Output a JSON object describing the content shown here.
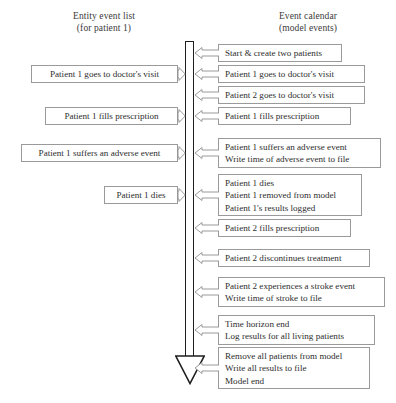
{
  "headings": {
    "left": {
      "line1": "Entity event list",
      "line2": "(for patient 1)"
    },
    "right": {
      "line1": "Event calendar",
      "line2": "(model events)"
    }
  },
  "timeline": {
    "name": "simulation-time-arrow",
    "direction": "downward",
    "color": "#1e1e1e"
  },
  "left_events": [
    {
      "lines": [
        "Patient 1 goes to doctor's visit"
      ],
      "x": 31,
      "y": 65,
      "w": 147,
      "h": 18
    },
    {
      "lines": [
        "Patient 1 fills prescription"
      ],
      "x": 45,
      "y": 107,
      "w": 133,
      "h": 18
    },
    {
      "lines": [
        "Patient 1 suffers an adverse event"
      ],
      "x": 21,
      "y": 144,
      "w": 157,
      "h": 18
    },
    {
      "lines": [
        "Patient 1 dies"
      ],
      "x": 104,
      "y": 186,
      "w": 74,
      "h": 18
    }
  ],
  "right_events": [
    {
      "lines": [
        "Start & create two patients"
      ],
      "x": 218,
      "y": 44,
      "w": 124,
      "h": 18
    },
    {
      "lines": [
        "Patient 1 goes to doctor's visit"
      ],
      "x": 218,
      "y": 65,
      "w": 147,
      "h": 18
    },
    {
      "lines": [
        "Patient 2 goes to doctor's visit"
      ],
      "x": 218,
      "y": 86,
      "w": 147,
      "h": 18
    },
    {
      "lines": [
        "Patient 1 fills prescription"
      ],
      "x": 218,
      "y": 107,
      "w": 133,
      "h": 18
    },
    {
      "lines": [
        "Patient 1 suffers an adverse event",
        "Write time of adverse event to file"
      ],
      "x": 218,
      "y": 138,
      "w": 163,
      "h": 30
    },
    {
      "lines": [
        "Patient 1 dies",
        "Patient 1 removed from model",
        "Patient 1's results logged"
      ],
      "x": 218,
      "y": 174,
      "w": 144,
      "h": 42
    },
    {
      "lines": [
        "Patient 2 fills prescription"
      ],
      "x": 218,
      "y": 219,
      "w": 133,
      "h": 18
    },
    {
      "lines": [
        "Patient 2 discontinues treatment"
      ],
      "x": 218,
      "y": 249,
      "w": 152,
      "h": 18
    },
    {
      "lines": [
        "Patient 2 experiences a stroke event",
        "Write time of stroke to file"
      ],
      "x": 218,
      "y": 277,
      "w": 167,
      "h": 30
    },
    {
      "lines": [
        "Time horizon end",
        "Log results for all living patients"
      ],
      "x": 218,
      "y": 315,
      "w": 157,
      "h": 30
    },
    {
      "lines": [
        "Remove all patients from model",
        "Write all results to file",
        "Model end"
      ],
      "x": 218,
      "y": 347,
      "w": 152,
      "h": 42
    }
  ],
  "connectors_left_to_bar": [
    {
      "y": 74
    },
    {
      "y": 116
    },
    {
      "y": 153
    },
    {
      "y": 195
    }
  ],
  "connectors_bar_to_right": [
    {
      "y": 53
    },
    {
      "y": 74
    },
    {
      "y": 95
    },
    {
      "y": 116
    },
    {
      "y": 153
    },
    {
      "y": 195
    },
    {
      "y": 228
    },
    {
      "y": 258
    },
    {
      "y": 292
    },
    {
      "y": 330
    },
    {
      "y": 368
    }
  ]
}
